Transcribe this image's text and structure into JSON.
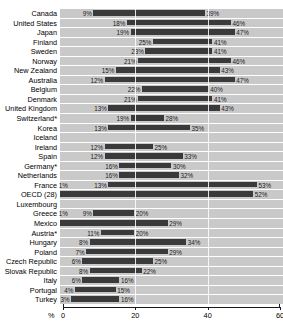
{
  "chart_data": {
    "type": "bar",
    "subtype": "horizontal-floating-range-bar",
    "title": "",
    "xlabel": "%",
    "ylabel": "",
    "xlim": [
      0,
      60
    ],
    "xticks": [
      0,
      20,
      40,
      60
    ],
    "xticklabels": [
      "0",
      "20",
      "40",
      "60"
    ],
    "grid": true,
    "legend": null,
    "unit_label": "%",
    "footnote_marker": "*",
    "categories": [
      "Canada",
      "United States",
      "Japan",
      "Finland",
      "Sweden",
      "Norway",
      "New Zealand",
      "Australia",
      "Belgium",
      "Denmark",
      "United Kingdom",
      "Switzerland*",
      "Korea",
      "Iceland",
      "Ireland",
      "Spain",
      "Germany*",
      "Netherlands",
      "France",
      "OECD (28)",
      "Luxembourg",
      "Greece",
      "Mexico",
      "Austria*",
      "Hungary",
      "Poland",
      "Czech Republic",
      "Slovak Republic",
      "Italy",
      "Portugal",
      "Turkey"
    ],
    "rows": [
      {
        "label": "Canada",
        "start": 9,
        "end": 39,
        "start_label": "9%",
        "end_label": "39%",
        "pre_label": null
      },
      {
        "label": "United States",
        "start": 18,
        "end": 46,
        "start_label": "18%",
        "end_label": "46%",
        "pre_label": null
      },
      {
        "label": "Japan",
        "start": 19,
        "end": 47,
        "start_label": "19%",
        "end_label": "47%",
        "pre_label": null
      },
      {
        "label": "Finland",
        "start": 25,
        "end": 41,
        "start_label": "25%",
        "end_label": "41%",
        "pre_label": null
      },
      {
        "label": "Sweden",
        "start": 23,
        "end": 41,
        "start_label": "23%",
        "end_label": "41%",
        "pre_label": null
      },
      {
        "label": "Norway",
        "start": 21,
        "end": 46,
        "start_label": "21%",
        "end_label": "46%",
        "pre_label": null
      },
      {
        "label": "New Zealand",
        "start": 15,
        "end": 43,
        "start_label": "15%",
        "end_label": "43%",
        "pre_label": null
      },
      {
        "label": "Australia",
        "start": 12,
        "end": 47,
        "start_label": "12%",
        "end_label": "47%",
        "pre_label": null
      },
      {
        "label": "Belgium",
        "start": 22,
        "end": 40,
        "start_label": "22%",
        "end_label": "40%",
        "pre_label": null
      },
      {
        "label": "Denmark",
        "start": 21,
        "end": 41,
        "start_label": "21%",
        "end_label": "41%",
        "pre_label": null
      },
      {
        "label": "United Kingdom",
        "start": 13,
        "end": 43,
        "start_label": "13%",
        "end_label": "43%",
        "pre_label": null
      },
      {
        "label": "Switzerland*",
        "start": 19,
        "end": 28,
        "start_label": "19%",
        "end_label": "28%",
        "pre_label": null
      },
      {
        "label": "Korea",
        "start": 13,
        "end": 35,
        "start_label": "13%",
        "end_label": "35%",
        "pre_label": null
      },
      {
        "label": "Iceland",
        "start": null,
        "end": null,
        "start_label": null,
        "end_label": null,
        "pre_label": null
      },
      {
        "label": "Ireland",
        "start": 12,
        "end": 25,
        "start_label": "12%",
        "end_label": "25%",
        "pre_label": null
      },
      {
        "label": "Spain",
        "start": 12,
        "end": 33,
        "start_label": "12%",
        "end_label": "33%",
        "pre_label": null
      },
      {
        "label": "Germany*",
        "start": 16,
        "end": 30,
        "start_label": "16%",
        "end_label": "30%",
        "pre_label": null
      },
      {
        "label": "Netherlands",
        "start": 16,
        "end": 32,
        "start_label": "16%",
        "end_label": "32%",
        "pre_label": null
      },
      {
        "label": "France",
        "start": 13,
        "end": 53,
        "start_label": "13%",
        "end_label": "53%",
        "pre_label": "1%"
      },
      {
        "label": "OECD (28)",
        "start": 0,
        "end": 52,
        "start_label": null,
        "end_label": "52%",
        "pre_label": null
      },
      {
        "label": "Luxembourg",
        "start": null,
        "end": null,
        "start_label": null,
        "end_label": null,
        "pre_label": null
      },
      {
        "label": "Greece",
        "start": 9,
        "end": 20,
        "start_label": "9%",
        "end_label": "20%",
        "pre_label": "1%"
      },
      {
        "label": "Mexico",
        "start": 0,
        "end": 29,
        "start_label": null,
        "end_label": "29%",
        "pre_label": null
      },
      {
        "label": "Austria*",
        "start": 11,
        "end": 20,
        "start_label": "11%",
        "end_label": "20%",
        "pre_label": null
      },
      {
        "label": "Hungary",
        "start": 8,
        "end": 34,
        "start_label": "8%",
        "end_label": "34%",
        "pre_label": null
      },
      {
        "label": "Poland",
        "start": 7,
        "end": 29,
        "start_label": "7%",
        "end_label": "29%",
        "pre_label": null
      },
      {
        "label": "Czech Republic",
        "start": 6,
        "end": 25,
        "start_label": "6%",
        "end_label": "25%",
        "pre_label": null
      },
      {
        "label": "Slovak Republic",
        "start": 8,
        "end": 22,
        "start_label": "8%",
        "end_label": "22%",
        "pre_label": null
      },
      {
        "label": "Italy",
        "start": 6,
        "end": 16,
        "start_label": "6%",
        "end_label": "16%",
        "pre_label": null
      },
      {
        "label": "Portugal",
        "start": 4,
        "end": 15,
        "start_label": "4%",
        "end_label": "15%",
        "pre_label": null
      },
      {
        "label": "Turkey",
        "start": 3,
        "end": 16,
        "start_label": "3%",
        "end_label": "16%",
        "pre_label": null
      }
    ],
    "colors": {
      "bar": "#3a3a3a",
      "track": "#c9c9c9",
      "axis": "#1a1a1a",
      "label": "#000000",
      "gridline": "#ffffff"
    }
  }
}
